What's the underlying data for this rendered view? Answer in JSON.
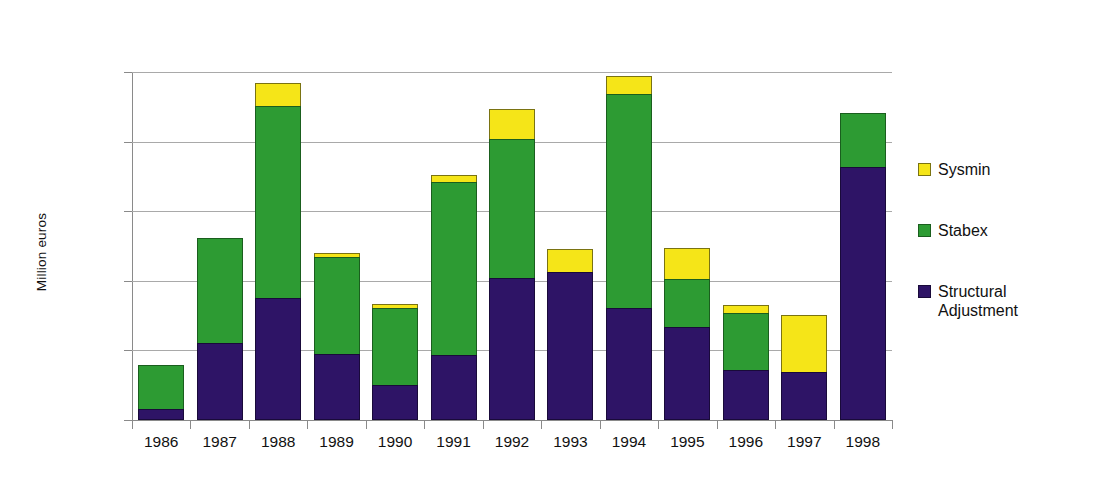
{
  "chart_data": {
    "type": "bar",
    "subtype": "stacked-bar",
    "title": "",
    "xlabel": "",
    "ylabel": "Million euros",
    "ylim": [
      0,
      1000
    ],
    "ytick_values": [
      0,
      200,
      400,
      600,
      800,
      1000
    ],
    "ytick_labels": [
      "0",
      "200",
      "400",
      "600",
      "800",
      "1000"
    ],
    "grid": true,
    "grid_axis": "y",
    "legend_position": "right",
    "categories": [
      "1986",
      "1987",
      "1988",
      "1989",
      "1990",
      "1991",
      "1992",
      "1993",
      "1994",
      "1995",
      "1996",
      "1997",
      "1998"
    ],
    "series": [
      {
        "name": "Structural Adjustment",
        "color": "#2E1466",
        "values": [
          33,
          222,
          350,
          190,
          100,
          187,
          408,
          425,
          322,
          268,
          143,
          138,
          727
        ]
      },
      {
        "name": "Stabex",
        "color": "#2D9B33",
        "values": [
          128,
          303,
          555,
          280,
          225,
          500,
          402,
          0,
          618,
          140,
          167,
          0,
          158
        ]
      },
      {
        "name": "Sysmin",
        "color": "#F5E518",
        "values": [
          0,
          0,
          70,
          17,
          15,
          23,
          90,
          68,
          55,
          92,
          27,
          167,
          0
        ]
      }
    ],
    "totals": [
      161,
      525,
      975,
      487,
      340,
      710,
      900,
      493,
      995,
      500,
      337,
      305,
      885
    ]
  },
  "legend": {
    "entries": [
      {
        "label": "Sysmin",
        "key": "sysmin"
      },
      {
        "label": "Stabex",
        "key": "stabex"
      },
      {
        "label": "Structural\nAdjustment",
        "key": "structural"
      }
    ]
  }
}
